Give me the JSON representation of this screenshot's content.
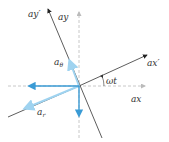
{
  "diagram": {
    "title": "",
    "labels": {
      "ax": "ax",
      "ay": "ay",
      "ax_prime": "ax′",
      "ay_prime": "ay′",
      "omega_t": "ωt",
      "a_theta_base": "a",
      "a_theta_sub": "θ",
      "a_r_base": "a",
      "a_r_sub": "r"
    },
    "colors": {
      "axis": "#c8c8c8",
      "rotated_axis": "#333333",
      "component_dark": "#3a9bd5",
      "component_light": "#9fd3f0",
      "text": "#333333"
    },
    "angle_label": "ωt"
  }
}
